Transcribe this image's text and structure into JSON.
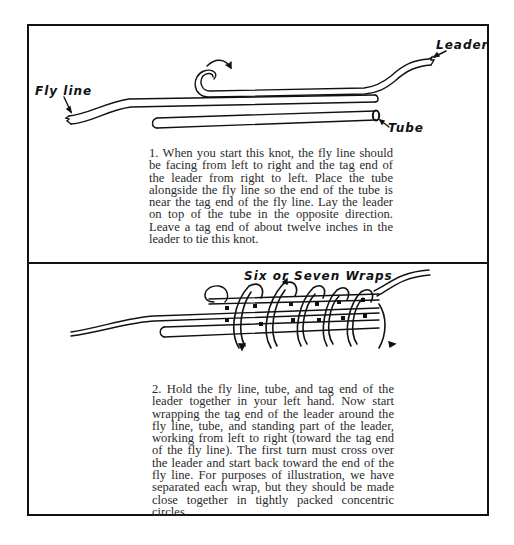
{
  "panel1": {
    "labels": {
      "leader": "Leader",
      "fly_line": "Fly line",
      "tube": "Tube"
    },
    "caption": "1. When you start this knot, the fly line should be facing from left to right and the tag end of the leader from right to left. Place the tube alongside the fly line so the end of the tube is near the tag end of the fly line. Lay the leader on top of the tube in the opposite direction. Leave a tag end of about twelve inches in the leader to tie this knot."
  },
  "panel2": {
    "labels": {
      "wraps": "Six or Seven Wraps"
    },
    "caption": "2. Hold the fly line, tube, and tag end of the leader together in your left hand. Now start wrapping the tag end of the leader around the fly line, tube, and standing part of the leader, working from left to right (toward the tag end of the fly line). The first turn must cross over the leader and start back toward the end of the fly line. For purposes of illustration, we have separated each wrap, but they should be made close together in tightly packed concentric circles."
  }
}
